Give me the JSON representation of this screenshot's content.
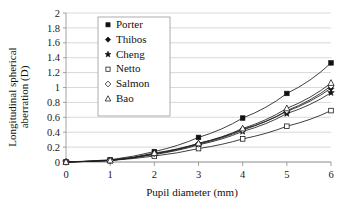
{
  "chart_data": {
    "type": "line",
    "title": "",
    "xlabel": "Pupil diameter (mm)",
    "ylabel": "Longitudinal spherical aberration (D)",
    "ylabel_line1": "Longitudinal spherical",
    "ylabel_line2": "aberration (D)",
    "x": [
      0,
      1,
      2,
      3,
      4,
      5,
      6
    ],
    "xlim": [
      0,
      6
    ],
    "ylim": [
      0,
      2
    ],
    "xticks": [
      "0",
      "1",
      "2",
      "3",
      "4",
      "5",
      "6"
    ],
    "yticks": [
      "0",
      "0.2",
      "0.4",
      "0.6",
      "0.8",
      "1",
      "1.2",
      "1.4",
      "1.6",
      "1.8",
      "2"
    ],
    "grid": "horizontal",
    "legend_position": "upper-left-inside",
    "series": [
      {
        "name": "Porter",
        "marker": "filled-square",
        "color": "#111111",
        "values": [
          0.0,
          0.03,
          0.14,
          0.33,
          0.59,
          0.92,
          1.33
        ]
      },
      {
        "name": "Thibos",
        "marker": "filled-diamond",
        "color": "#111111",
        "values": [
          0.0,
          0.02,
          0.11,
          0.25,
          0.44,
          0.68,
          0.99
        ]
      },
      {
        "name": "Cheng",
        "marker": "filled-star",
        "color": "#111111",
        "values": [
          0.0,
          0.02,
          0.1,
          0.23,
          0.41,
          0.65,
          0.93
        ]
      },
      {
        "name": "Netto",
        "marker": "open-square",
        "color": "#111111",
        "values": [
          0.0,
          0.02,
          0.08,
          0.18,
          0.31,
          0.48,
          0.69
        ]
      },
      {
        "name": "Salmon",
        "marker": "open-diamond",
        "color": "#111111",
        "values": [
          0.0,
          0.02,
          0.11,
          0.24,
          0.43,
          0.69,
          1.02
        ]
      },
      {
        "name": "Bao",
        "marker": "open-triangle",
        "color": "#111111",
        "values": [
          0.0,
          0.02,
          0.12,
          0.25,
          0.45,
          0.72,
          1.06
        ]
      }
    ]
  },
  "legend": {
    "entries": [
      {
        "label": "Porter",
        "marker": "filled-square"
      },
      {
        "label": "Thibos",
        "marker": "filled-diamond"
      },
      {
        "label": "Cheng",
        "marker": "filled-star"
      },
      {
        "label": "Netto",
        "marker": "open-square"
      },
      {
        "label": "Salmon",
        "marker": "open-diamond"
      },
      {
        "label": "Bao",
        "marker": "open-triangle"
      }
    ]
  },
  "colors": {
    "ink": "#111111",
    "grid": "#c9c9c9",
    "axis": "#8a8a8a",
    "background": "#ffffff"
  }
}
